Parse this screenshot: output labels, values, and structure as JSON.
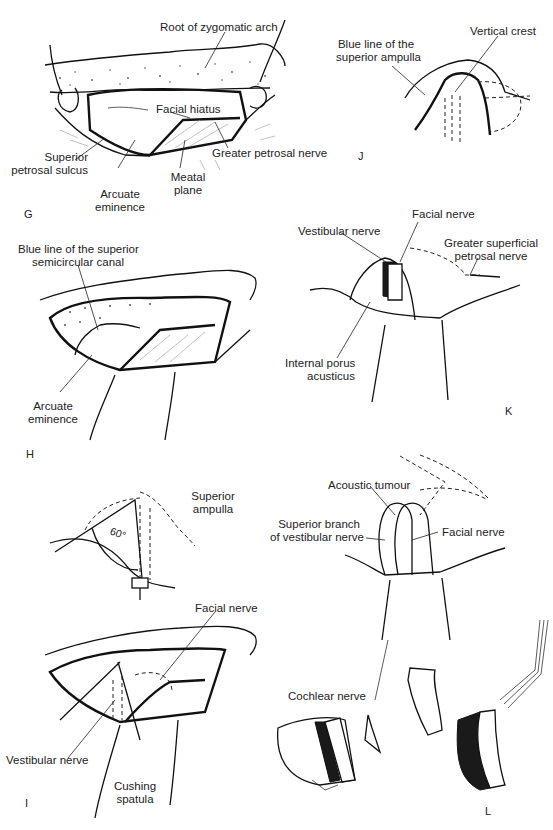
{
  "figure": {
    "panels": [
      {
        "id": "G",
        "letter": "G",
        "labels": {
          "root_zygomatic": "Root of zygomatic arch",
          "facial_hiatus": "Facial hiatus",
          "greater_petrosal": "Greater petrosal nerve",
          "sup_petrosal_1": "Superior",
          "sup_petrosal_2": "petrosal sulcus",
          "arcuate_1": "Arcuate",
          "arcuate_2": "eminence",
          "meatal_1": "Meatal",
          "meatal_2": "plane"
        }
      },
      {
        "id": "J",
        "letter": "J",
        "labels": {
          "blue_line_1": "Blue line of the",
          "blue_line_2": "superior ampulla",
          "vertical_crest": "Vertical crest"
        }
      },
      {
        "id": "H",
        "letter": "H",
        "labels": {
          "blue_line_1": "Blue line of the superior",
          "blue_line_2": "semicircular canal",
          "arcuate_1": "Arcuate",
          "arcuate_2": "eminence"
        }
      },
      {
        "id": "K",
        "letter": "K",
        "labels": {
          "facial_nerve": "Facial nerve",
          "vestibular_nerve": "Vestibular nerve",
          "gsp_1": "Greater superficial",
          "gsp_2": "petrosal nerve",
          "porus_1": "Internal porus",
          "porus_2": "acusticus"
        }
      },
      {
        "id": "I",
        "letter": "I",
        "labels": {
          "sup_ampulla_1": "Superior",
          "sup_ampulla_2": "ampulla",
          "angle": "60°",
          "facial_nerve": "Facial nerve",
          "vestibular_nerve": "Vestibular nerve",
          "cushing_1": "Cushing",
          "cushing_2": "spatula"
        }
      },
      {
        "id": "L",
        "letter": "L",
        "labels": {
          "acoustic_tumour": "Acoustic tumour",
          "sup_branch_1": "Superior branch",
          "sup_branch_2": "of vestibular nerve",
          "facial_nerve": "Facial nerve",
          "cochlear_nerve": "Cochlear nerve"
        }
      }
    ]
  }
}
